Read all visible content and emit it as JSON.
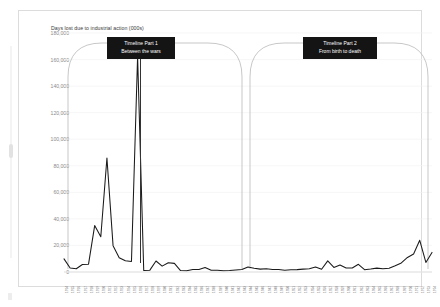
{
  "chart_data": {
    "type": "line",
    "title": "Days lost due to industrial action (000s)",
    "xlabel": "",
    "ylabel": "",
    "ylim": [
      0,
      180000
    ],
    "ytick_step": 20000,
    "yticks": [
      "0",
      "20,000",
      "40,000",
      "60,000",
      "80,000",
      "100,000",
      "120,000",
      "140,000",
      "160,000",
      "180,000"
    ],
    "grid": true,
    "legend": "none",
    "series_color": "#1a1a1a",
    "categories": [
      "1914",
      "1915",
      "1916",
      "1917",
      "1918",
      "1919",
      "1920",
      "1921",
      "1922",
      "1923",
      "1924",
      "1925",
      "1926",
      "1927",
      "1928",
      "1929",
      "1930",
      "1931",
      "1932",
      "1933",
      "1934",
      "1935",
      "1936",
      "1937",
      "1938",
      "1939",
      "1940",
      "1941",
      "1942",
      "1943",
      "1944",
      "1945",
      "1946",
      "1947",
      "1948",
      "1949",
      "1950",
      "1951",
      "1952",
      "1953",
      "1954",
      "1955",
      "1956",
      "1957",
      "1958",
      "1959",
      "1960",
      "1961",
      "1962",
      "1963",
      "1964",
      "1965",
      "1966",
      "1967",
      "1968",
      "1969",
      "1970",
      "1971",
      "1972",
      "1973",
      "1974"
    ],
    "values": [
      9900,
      2950,
      2450,
      5650,
      5900,
      34970,
      26570,
      85870,
      19850,
      10670,
      8420,
      7950,
      162230,
      1170,
      1390,
      8290,
      4400,
      6980,
      6490,
      1070,
      960,
      1960,
      1830,
      3410,
      1330,
      1360,
      940,
      1080,
      1530,
      1810,
      3710,
      2840,
      2160,
      2430,
      1940,
      1810,
      1390,
      1690,
      1790,
      2180,
      2460,
      3780,
      2080,
      8410,
      3460,
      5270,
      3020,
      3050,
      5800,
      1760,
      2280,
      2930,
      2400,
      2780,
      4700,
      6850,
      10980,
      13550,
      23900,
      7200,
      14750
    ],
    "annotations": [
      {
        "name": "timeline-part-1",
        "line1": "Timeline Part 1",
        "line2": "Between the wars"
      },
      {
        "name": "timeline-part-2",
        "line1": "Timeline Part 2",
        "line2": "From birth to death"
      }
    ]
  },
  "chart": {
    "title": "Days lost due to industrial action (000s)"
  },
  "callouts": {
    "part1": {
      "line1": "Timeline Part 1",
      "line2": "Between the wars"
    },
    "part2": {
      "line1": "Timeline Part 2",
      "line2": "From birth to death"
    }
  }
}
